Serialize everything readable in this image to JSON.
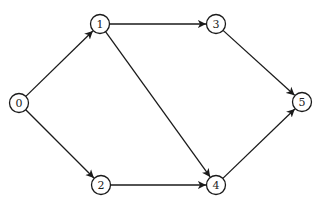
{
  "diagram": {
    "type": "directed-graph",
    "nodes": [
      {
        "id": "0",
        "label": "0",
        "x": 19,
        "y": 103
      },
      {
        "id": "1",
        "label": "1",
        "x": 100,
        "y": 24
      },
      {
        "id": "2",
        "label": "2",
        "x": 101,
        "y": 185
      },
      {
        "id": "3",
        "label": "3",
        "x": 216,
        "y": 24
      },
      {
        "id": "4",
        "label": "4",
        "x": 216,
        "y": 185
      },
      {
        "id": "5",
        "label": "5",
        "x": 302,
        "y": 102
      }
    ],
    "edges": [
      {
        "from": "0",
        "to": "1"
      },
      {
        "from": "0",
        "to": "2"
      },
      {
        "from": "1",
        "to": "3"
      },
      {
        "from": "1",
        "to": "4"
      },
      {
        "from": "2",
        "to": "4"
      },
      {
        "from": "3",
        "to": "5"
      },
      {
        "from": "4",
        "to": "5"
      }
    ],
    "node_radius": 9.5,
    "colors": {
      "stroke": "#1a1a1a",
      "fill": "#ffffff",
      "text": "#222222"
    }
  }
}
